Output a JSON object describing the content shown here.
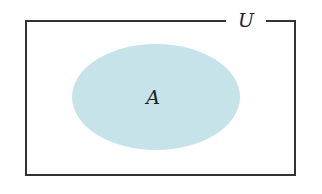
{
  "diagram": {
    "type": "venn",
    "universe": {
      "label": "U",
      "stroke": "#333333",
      "rect": {
        "x": 26,
        "y": 21,
        "width": 269,
        "height": 154
      }
    },
    "sets": [
      {
        "label": "A",
        "fill": "#c6e3ea",
        "ellipse": {
          "cx": 156,
          "cy": 97,
          "rx": 84,
          "ry": 53
        }
      }
    ]
  }
}
